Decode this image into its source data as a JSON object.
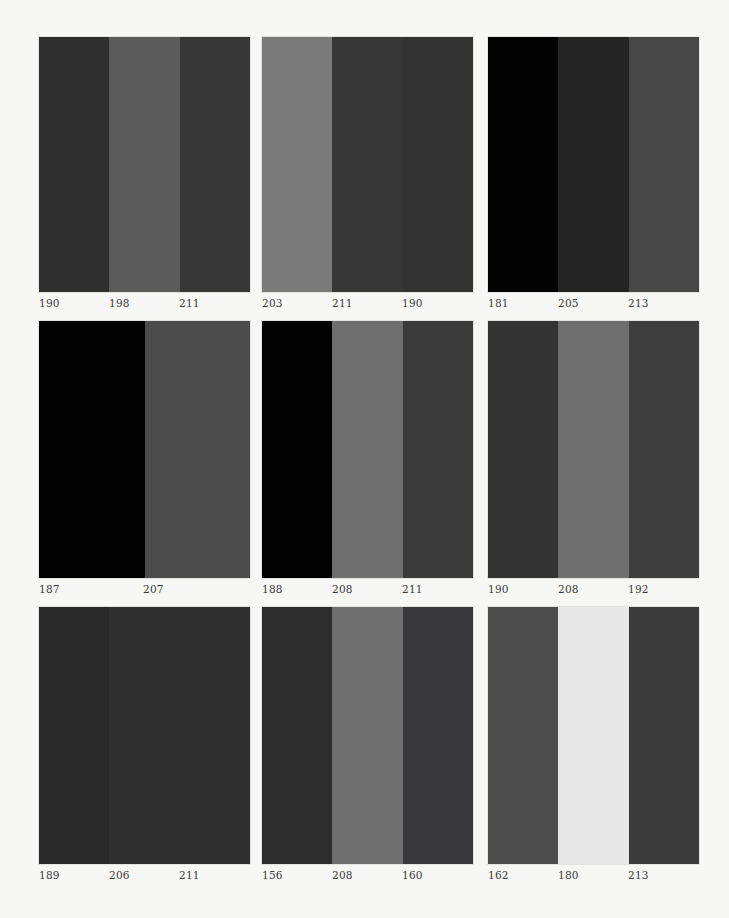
{
  "page": {
    "background": "#f7f7f5"
  },
  "panels": [
    {
      "stripes": [
        {
          "label": "190",
          "color": "#2f2f30"
        },
        {
          "label": "198",
          "color": "#5b5b5b"
        },
        {
          "label": "211",
          "color": "#363637"
        }
      ]
    },
    {
      "stripes": [
        {
          "label": "203",
          "color": "#7a7a7a"
        },
        {
          "label": "211",
          "color": "#363637"
        },
        {
          "label": "190",
          "color": "#333334"
        }
      ]
    },
    {
      "stripes": [
        {
          "label": "181",
          "color": "#030303"
        },
        {
          "label": "205",
          "color": "#242425"
        },
        {
          "label": "213",
          "color": "#474748"
        }
      ]
    },
    {
      "stripes": [
        {
          "label": "187",
          "color": "#020202"
        },
        {
          "label": "207",
          "color": "#4c4c4d"
        }
      ]
    },
    {
      "stripes": [
        {
          "label": "188",
          "color": "#020202"
        },
        {
          "label": "208",
          "color": "#6e6e6e"
        },
        {
          "label": "211",
          "color": "#3a3a3b"
        }
      ]
    },
    {
      "stripes": [
        {
          "label": "190",
          "color": "#333334"
        },
        {
          "label": "208",
          "color": "#6e6e6e"
        },
        {
          "label": "192",
          "color": "#3e3e3f"
        }
      ]
    },
    {
      "stripes": [
        {
          "label": "189",
          "color": "#2a2a2b"
        },
        {
          "label": "206",
          "color": "#303031"
        },
        {
          "label": "211",
          "color": "#303031"
        }
      ]
    },
    {
      "stripes": [
        {
          "label": "156",
          "color": "#2d2d2e"
        },
        {
          "label": "208",
          "color": "#6f6f6f"
        },
        {
          "label": "160",
          "color": "#38383a"
        }
      ]
    },
    {
      "stripes": [
        {
          "label": "162",
          "color": "#4d4d4e"
        },
        {
          "label": "180",
          "color": "#e8e8e8"
        },
        {
          "label": "213",
          "color": "#3b3b3c"
        }
      ]
    }
  ]
}
